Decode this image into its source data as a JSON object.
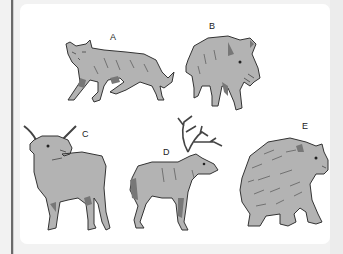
{
  "figure": {
    "background": "#f2f2f2",
    "panel_color": "#ffffff",
    "animals": [
      {
        "label": "A",
        "name": "wolf"
      },
      {
        "label": "B",
        "name": "wild boar"
      },
      {
        "label": "C",
        "name": "long-horned cattle"
      },
      {
        "label": "D",
        "name": "reindeer"
      },
      {
        "label": "E",
        "name": "bear"
      }
    ]
  }
}
